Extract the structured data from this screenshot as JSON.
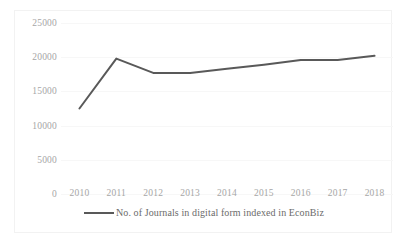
{
  "figure": {
    "border_color": "#f2f2f2",
    "background": "#ffffff"
  },
  "legend": {
    "position": "bottom-center",
    "swatch_icon": "line-swatch",
    "label": "No. of Journals in digital form indexed in EconBiz",
    "color": "#595959"
  },
  "axis": {
    "y_ticks": [
      "25000",
      "20000",
      "15000",
      "10000",
      "5000",
      "0"
    ],
    "x_ticks": [
      "2010",
      "2011",
      "2012",
      "2013",
      "2014",
      "2015",
      "2016",
      "2017",
      "2018"
    ]
  },
  "chart_data": {
    "type": "line",
    "title": "",
    "xlabel": "",
    "ylabel": "",
    "categories": [
      "2010",
      "2011",
      "2012",
      "2013",
      "2014",
      "2015",
      "2016",
      "2017",
      "2018"
    ],
    "x": [
      2010,
      2011,
      2012,
      2013,
      2014,
      2015,
      2016,
      2017,
      2018
    ],
    "series": [
      {
        "name": "No. of Journals in digital form indexed in EconBiz",
        "color": "#595959",
        "values": [
          12500,
          19800,
          17700,
          17700,
          18300,
          18900,
          19600,
          19600,
          20200
        ]
      }
    ],
    "ylim": [
      0,
      25000
    ],
    "ytick_values": [
      25000,
      20000,
      15000,
      10000,
      5000,
      0
    ],
    "grid": true,
    "grid_color": "#f7f7f7",
    "legend_position": "bottom-center",
    "line_width": 2
  }
}
